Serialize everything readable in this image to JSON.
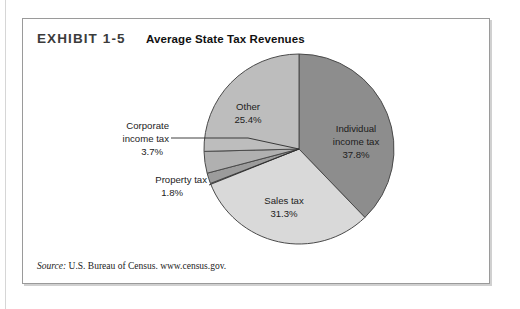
{
  "exhibit": {
    "number": "EXHIBIT 1-5",
    "title": "Average State Tax Revenues",
    "source": "U.S. Bureau of Census. www.census.gov.",
    "source_label": "Source:"
  },
  "chart_data": {
    "type": "pie",
    "title": "Average State Tax Revenues",
    "xlabel": "",
    "ylabel": "",
    "legend": "none",
    "start_angle_deg": 0,
    "direction": "clockwise",
    "categories": [
      "Individual income tax",
      "Sales tax",
      "Property tax",
      "Corporate income tax",
      "Other"
    ],
    "values": [
      37.8,
      31.3,
      1.8,
      3.7,
      25.4
    ],
    "unit": "%",
    "colors": [
      "#8d8d8d",
      "#d9d9d9",
      "#9c9c9c",
      "#b0b0b0",
      "#bdbdbd"
    ],
    "slices": [
      {
        "name": "Individual income tax",
        "value": 37.8,
        "label_line1": "Individual",
        "label_line2": "income tax",
        "label_value": "37.8%",
        "color": "#8d8d8d",
        "label_placement": "inside"
      },
      {
        "name": "Sales tax",
        "value": 31.3,
        "label_line1": "Sales tax",
        "label_line2": "",
        "label_value": "31.3%",
        "color": "#d9d9d9",
        "label_placement": "inside"
      },
      {
        "name": "Property tax",
        "value": 1.8,
        "label_line1": "Property tax",
        "label_line2": "",
        "label_value": "1.8%",
        "color": "#9c9c9c",
        "label_placement": "callout"
      },
      {
        "name": "Corporate income tax",
        "value": 3.7,
        "label_line1": "Corporate",
        "label_line2": "income tax",
        "label_value": "3.7%",
        "color": "#b0b0b0",
        "label_placement": "callout"
      },
      {
        "name": "Other",
        "value": 25.4,
        "label_line1": "Other",
        "label_line2": "",
        "label_value": "25.4%",
        "color": "#bdbdbd",
        "label_placement": "inside"
      }
    ]
  }
}
